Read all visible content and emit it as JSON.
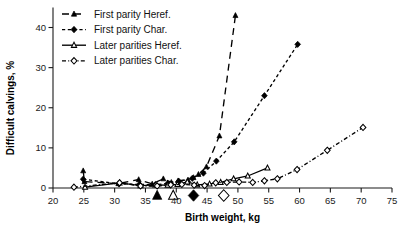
{
  "chart_data": {
    "type": "line",
    "title": "",
    "xlabel": "Birth weight, kg",
    "ylabel": "Difficult calvings, %",
    "xlim": [
      20,
      75
    ],
    "ylim": [
      -3,
      45
    ],
    "xticks": [
      20,
      25,
      30,
      35,
      40,
      45,
      50,
      55,
      60,
      65,
      70,
      75
    ],
    "yticks": [
      0,
      10,
      20,
      30,
      40
    ],
    "grid": false,
    "legend_position": "top-left",
    "series": [
      {
        "name": "First parity Heref.",
        "marker": "filled-triangle",
        "linestyle": "dashed-long",
        "color": "#000000",
        "points": [
          {
            "x": 24.9,
            "y": 4.3
          },
          {
            "x": 25.1,
            "y": 1.6
          },
          {
            "x": 30.6,
            "y": 1.1
          },
          {
            "x": 33.9,
            "y": 2.1
          },
          {
            "x": 36.1,
            "y": 1.0
          },
          {
            "x": 37.9,
            "y": 2.3
          },
          {
            "x": 39.2,
            "y": 1.4
          },
          {
            "x": 40.3,
            "y": 1.8
          },
          {
            "x": 41.9,
            "y": 2.0
          },
          {
            "x": 42.8,
            "y": 2.6
          },
          {
            "x": 43.6,
            "y": 3.4
          },
          {
            "x": 44.9,
            "y": 5.3
          },
          {
            "x": 47.0,
            "y": 13.0
          },
          {
            "x": 49.6,
            "y": 43.0
          }
        ]
      },
      {
        "name": "First parity Char.",
        "marker": "filled-diamond",
        "linestyle": "dashed-short",
        "color": "#000000",
        "points": [
          {
            "x": 24.9,
            "y": 2.2
          },
          {
            "x": 30.7,
            "y": 1.0
          },
          {
            "x": 34.0,
            "y": 0.9
          },
          {
            "x": 36.6,
            "y": 0.8
          },
          {
            "x": 38.6,
            "y": 1.1
          },
          {
            "x": 40.4,
            "y": 1.7
          },
          {
            "x": 42.6,
            "y": 2.4
          },
          {
            "x": 44.4,
            "y": 3.7
          },
          {
            "x": 46.5,
            "y": 6.7
          },
          {
            "x": 49.4,
            "y": 11.5
          },
          {
            "x": 54.3,
            "y": 23.0
          },
          {
            "x": 59.7,
            "y": 35.8
          }
        ]
      },
      {
        "name": "Later parities Heref.",
        "marker": "open-triangle",
        "linestyle": "solid",
        "color": "#000000",
        "points": [
          {
            "x": 25.2,
            "y": 0.2
          },
          {
            "x": 30.8,
            "y": 1.3
          },
          {
            "x": 34.2,
            "y": 0.6
          },
          {
            "x": 36.6,
            "y": 0.8
          },
          {
            "x": 38.6,
            "y": 0.7
          },
          {
            "x": 40.2,
            "y": 0.9
          },
          {
            "x": 41.8,
            "y": 1.5
          },
          {
            "x": 43.4,
            "y": 0.8
          },
          {
            "x": 45.4,
            "y": 1.0
          },
          {
            "x": 47.2,
            "y": 1.4
          },
          {
            "x": 49.3,
            "y": 2.3
          },
          {
            "x": 51.6,
            "y": 3.0
          },
          {
            "x": 54.8,
            "y": 5.0
          }
        ]
      },
      {
        "name": "Later parities Char.",
        "marker": "open-diamond",
        "linestyle": "dash-dot",
        "color": "#000000",
        "points": [
          {
            "x": 23.4,
            "y": 0.2
          },
          {
            "x": 30.8,
            "y": 1.3
          },
          {
            "x": 34.2,
            "y": 0.5
          },
          {
            "x": 36.9,
            "y": 0.5
          },
          {
            "x": 39.1,
            "y": 0.8
          },
          {
            "x": 40.9,
            "y": 0.9
          },
          {
            "x": 42.9,
            "y": 0.7
          },
          {
            "x": 44.6,
            "y": 0.6
          },
          {
            "x": 46.4,
            "y": 1.3
          },
          {
            "x": 48.2,
            "y": 1.4
          },
          {
            "x": 50.2,
            "y": 1.5
          },
          {
            "x": 52.4,
            "y": 1.4
          },
          {
            "x": 54.3,
            "y": 1.8
          },
          {
            "x": 56.4,
            "y": 2.3
          },
          {
            "x": 59.6,
            "y": 4.6
          },
          {
            "x": 64.5,
            "y": 9.4
          },
          {
            "x": 70.3,
            "y": 15.1
          }
        ]
      }
    ],
    "mean_markers": [
      {
        "x": 36.9,
        "marker": "filled-triangle",
        "label": "First parity Heref. mean"
      },
      {
        "x": 39.5,
        "marker": "open-triangle",
        "label": "Later parities Heref. mean"
      },
      {
        "x": 42.8,
        "marker": "filled-diamond",
        "label": "First parity Char. mean"
      },
      {
        "x": 47.7,
        "marker": "open-diamond",
        "label": "Later parities Char. mean"
      }
    ]
  },
  "legend": {
    "items": [
      {
        "label": "First parity Heref.",
        "marker": "filled-triangle",
        "linestyle": "dashed-long"
      },
      {
        "label": "First parity Char.",
        "marker": "filled-diamond",
        "linestyle": "dashed-short"
      },
      {
        "label": "Later parities Heref.",
        "marker": "open-triangle",
        "linestyle": "solid"
      },
      {
        "label": "Later parities Char.",
        "marker": "open-diamond",
        "linestyle": "dash-dot"
      }
    ]
  },
  "axes": {
    "x_title": "Birth weight, kg",
    "y_title": "Difficult calvings, %",
    "x_tick_labels": [
      "20",
      "25",
      "30",
      "35",
      "40",
      "45",
      "50",
      "55",
      "60",
      "65",
      "70",
      "75"
    ],
    "y_tick_labels": [
      "0",
      "10",
      "20",
      "30",
      "40"
    ]
  }
}
